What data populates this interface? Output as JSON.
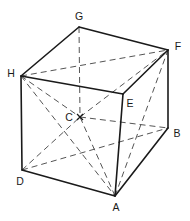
{
  "figure": {
    "title": "",
    "type": "geometric-solid-diagram",
    "shape": "cube",
    "background_color": "#ffffff",
    "stroke_color": "#1a1a1a",
    "dash_color": "#555555",
    "labels": {
      "A": "A",
      "B": "B",
      "C": "C",
      "D": "D",
      "E": "E",
      "F": "F",
      "G": "G",
      "H": "H"
    },
    "vertices": [
      {
        "id": "A",
        "label": "A",
        "x": 115,
        "y": 196,
        "label_x": 116,
        "label_y": 208,
        "hidden": false
      },
      {
        "id": "B",
        "label": "B",
        "x": 168,
        "y": 128,
        "label_x": 177,
        "label_y": 134,
        "hidden": false
      },
      {
        "id": "C",
        "label": "C",
        "x": 80,
        "y": 117,
        "label_x": 69,
        "label_y": 118,
        "hidden": true
      },
      {
        "id": "D",
        "label": "D",
        "x": 22,
        "y": 170,
        "label_x": 20,
        "label_y": 182,
        "hidden": false
      },
      {
        "id": "E",
        "label": "E",
        "x": 123,
        "y": 94,
        "label_x": 130,
        "label_y": 104,
        "hidden": false
      },
      {
        "id": "F",
        "label": "F",
        "x": 168,
        "y": 50,
        "label_x": 178,
        "label_y": 47,
        "hidden": false
      },
      {
        "id": "G",
        "label": "G",
        "x": 79,
        "y": 27,
        "label_x": 79,
        "label_y": 17,
        "hidden": true
      },
      {
        "id": "H",
        "label": "H",
        "x": 21,
        "y": 76,
        "label_x": 11,
        "label_y": 74,
        "hidden": false
      }
    ],
    "solid_edges": [
      {
        "from": "H",
        "to": "G"
      },
      {
        "from": "G",
        "to": "F"
      },
      {
        "from": "H",
        "to": "E"
      },
      {
        "from": "E",
        "to": "F"
      },
      {
        "from": "H",
        "to": "D"
      },
      {
        "from": "E",
        "to": "A"
      },
      {
        "from": "F",
        "to": "B"
      },
      {
        "from": "D",
        "to": "A"
      },
      {
        "from": "A",
        "to": "B"
      }
    ],
    "dashed_edges": [
      {
        "from": "H",
        "to": "F"
      },
      {
        "from": "G",
        "to": "C"
      },
      {
        "from": "D",
        "to": "C"
      },
      {
        "from": "C",
        "to": "F"
      },
      {
        "from": "H",
        "to": "C"
      },
      {
        "from": "C",
        "to": "B"
      },
      {
        "from": "A",
        "to": "C"
      },
      {
        "from": "H",
        "to": "A"
      },
      {
        "from": "A",
        "to": "F"
      },
      {
        "from": "D",
        "to": "B"
      }
    ],
    "centre_marker": {
      "at": "C",
      "glyph": "x",
      "size": 5
    }
  }
}
